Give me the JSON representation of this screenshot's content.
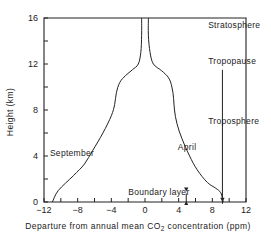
{
  "chart_data": {
    "type": "line",
    "title": "",
    "xlabel": "Departure from annual mean CO2 concentration (ppm)",
    "xlabel_parts": {
      "pre": "Departure from annual mean CO",
      "sub": "2",
      "post": " concentration (ppm)"
    },
    "ylabel": "Height (km)",
    "xlim": [
      -12,
      12
    ],
    "ylim": [
      0,
      16
    ],
    "x_ticks": [
      -12,
      -8,
      -4,
      0,
      4,
      8,
      12
    ],
    "x_tick_labels": [
      "−12",
      "−8",
      "−4",
      "0",
      "4",
      "8",
      "12"
    ],
    "x_minor_ticks": [
      -10,
      -6,
      -2,
      2,
      6,
      10
    ],
    "y_ticks": [
      0,
      4,
      8,
      12,
      16
    ],
    "y_tick_labels": [
      "0",
      "4",
      "8",
      "12",
      "16"
    ],
    "y_minor_ticks": [
      2,
      6,
      10,
      14
    ],
    "grid": false,
    "series": [
      {
        "name": "September",
        "points": [
          [
            -11.0,
            0
          ],
          [
            -10.3,
            1.0
          ],
          [
            -8.5,
            2.3
          ],
          [
            -7.2,
            3.3
          ],
          [
            -6.2,
            4.5
          ],
          [
            -5.0,
            6.0
          ],
          [
            -4.0,
            7.5
          ],
          [
            -3.6,
            8.5
          ],
          [
            -3.4,
            9.5
          ],
          [
            -3.0,
            10.4
          ],
          [
            -2.3,
            11.0
          ],
          [
            -1.5,
            11.5
          ],
          [
            -0.8,
            12.0
          ],
          [
            -0.5,
            13.0
          ],
          [
            -0.4,
            14.5
          ],
          [
            -0.4,
            16
          ]
        ]
      },
      {
        "name": "April",
        "points": [
          [
            0.4,
            16
          ],
          [
            0.4,
            14.5
          ],
          [
            0.6,
            13.0
          ],
          [
            1.0,
            12.0
          ],
          [
            2.0,
            11.4
          ],
          [
            2.8,
            10.8
          ],
          [
            3.2,
            10.0
          ],
          [
            3.4,
            9.0
          ],
          [
            3.5,
            8.0
          ],
          [
            3.8,
            6.8
          ],
          [
            4.4,
            5.5
          ],
          [
            5.3,
            4.0
          ],
          [
            6.2,
            2.8
          ],
          [
            7.4,
            1.7
          ],
          [
            8.4,
            1.2
          ],
          [
            9.0,
            0.8
          ],
          [
            9.3,
            0
          ]
        ]
      }
    ],
    "annotations": [
      {
        "text": "Stratosphere",
        "x": 7.5,
        "y": 15.1
      },
      {
        "text": "Tropopause",
        "x": 7.5,
        "y": 12.0
      },
      {
        "text": "Troposphere",
        "x": 7.5,
        "y": 6.8
      },
      {
        "text": "September",
        "x": -11.3,
        "y": 4.0
      },
      {
        "text": "April",
        "x": 3.9,
        "y": 4.5
      },
      {
        "text": "Boundary layer",
        "x": -2.0,
        "y": 0.6
      }
    ],
    "arrows": [
      {
        "label": "tropopause-to-surface-arrow",
        "x": 9.2,
        "from_y": 11.5,
        "to_y": 0.1
      },
      {
        "label": "boundary-layer-double-arrow",
        "x": 4.9,
        "from_y": 0,
        "to_y": 1.0
      }
    ]
  }
}
